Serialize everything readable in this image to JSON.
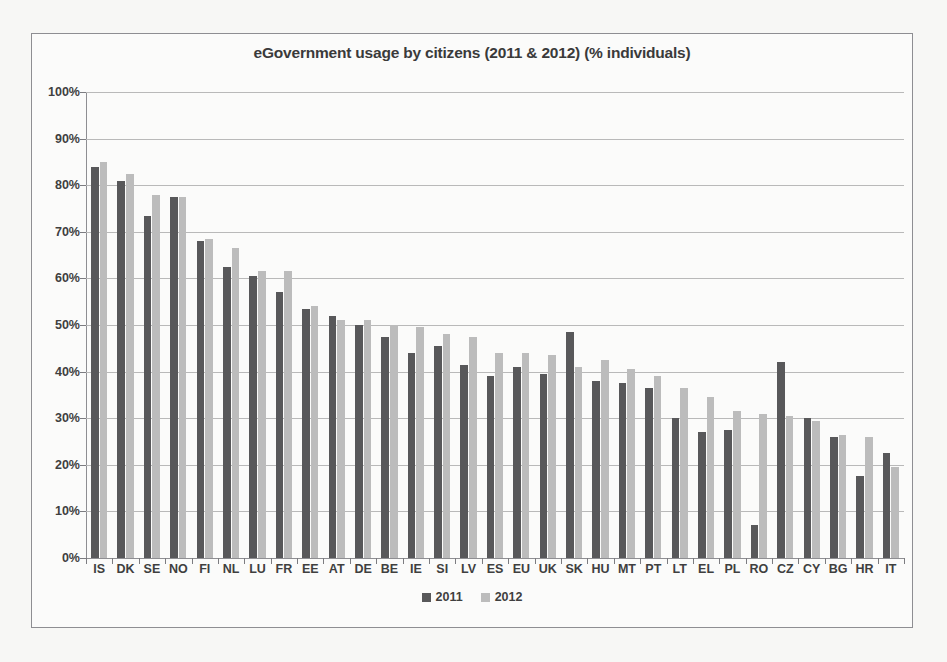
{
  "chart_data": {
    "type": "bar",
    "title": "eGovernment usage by citizens (2011 & 2012) (% individuals)",
    "xlabel": "",
    "ylabel": "",
    "ylim": [
      0,
      100
    ],
    "ytick_labels": [
      "100%",
      "90%",
      "80%",
      "70%",
      "60%",
      "50%",
      "40%",
      "30%",
      "20%",
      "10%",
      "0%"
    ],
    "ytick_values": [
      100,
      90,
      80,
      70,
      60,
      50,
      40,
      30,
      20,
      10,
      0
    ],
    "grid": true,
    "legend_position": "bottom-center",
    "categories": [
      "IS",
      "DK",
      "SE",
      "NO",
      "FI",
      "NL",
      "LU",
      "FR",
      "EE",
      "AT",
      "DE",
      "BE",
      "IE",
      "SI",
      "LV",
      "ES",
      "EU",
      "UK",
      "SK",
      "HU",
      "MT",
      "PT",
      "LT",
      "EL",
      "PL",
      "RO",
      "CZ",
      "CY",
      "BG",
      "HR",
      "IT"
    ],
    "series": [
      {
        "name": "2011",
        "color": "#58585a",
        "values": [
          84,
          81,
          73.5,
          77.5,
          68,
          62.5,
          60.5,
          57,
          53.5,
          52,
          50,
          47.5,
          44,
          45.5,
          41.5,
          39,
          41,
          39.5,
          48.5,
          38,
          37.5,
          36.5,
          30,
          27,
          27.5,
          7,
          42,
          30,
          26,
          17.5,
          22.5
        ]
      },
      {
        "name": "2012",
        "color": "#bcbcbc",
        "values": [
          85,
          82.5,
          78,
          77.5,
          68.5,
          66.5,
          61.5,
          61.5,
          54,
          51,
          51,
          50,
          49.5,
          48,
          47.5,
          44,
          44,
          43.5,
          41,
          42.5,
          40.5,
          39,
          36.5,
          34.5,
          31.5,
          31,
          30.5,
          29.5,
          26.5,
          26,
          19.5
        ]
      }
    ]
  },
  "legend": {
    "items": [
      {
        "label": "2011"
      },
      {
        "label": "2012"
      }
    ]
  }
}
